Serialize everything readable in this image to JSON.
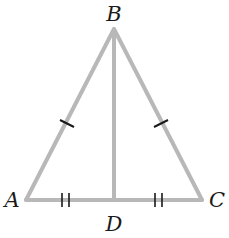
{
  "diagram": {
    "type": "isosceles-triangle-with-median",
    "vertices": {
      "A": {
        "label": "A"
      },
      "B": {
        "label": "B"
      },
      "C": {
        "label": "C"
      },
      "D": {
        "label": "D"
      }
    },
    "segments": [
      "AB",
      "BC",
      "CA",
      "BD"
    ],
    "congruence_marks": [
      {
        "segments": [
          "AB",
          "BC"
        ],
        "ticks": 1
      },
      {
        "segments": [
          "AD",
          "DC"
        ],
        "ticks": 2
      }
    ],
    "colors": {
      "line": "#b8b8b8",
      "tick": "#1a1a1a",
      "label": "#1a1a1a"
    }
  }
}
